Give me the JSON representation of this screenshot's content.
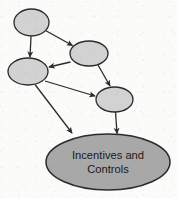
{
  "figure": {
    "type": "flow-diagram",
    "title": "",
    "background_color": "#fbfbfa",
    "stroke_color": "#2b2b2b",
    "node_fill_small": "#d2d2d2",
    "node_fill_outcome": "#a8a8a8",
    "text_color": "#1a1a1a"
  },
  "nodes": [
    {
      "id": "node-1",
      "name": "upper-left-node",
      "label": "",
      "cx": 31.5,
      "cy": 22.5,
      "rx": 17.5,
      "ry": 13.5,
      "fill": "#d2d2d2"
    },
    {
      "id": "node-2",
      "name": "upper-right-node",
      "label": "",
      "cx": 89.0,
      "cy": 53.5,
      "rx": 19.0,
      "ry": 12.5,
      "fill": "#d2d2d2"
    },
    {
      "id": "node-3",
      "name": "mid-left-node",
      "label": "",
      "cx": 28.0,
      "cy": 71.5,
      "rx": 20.0,
      "ry": 13.5,
      "fill": "#d2d2d2"
    },
    {
      "id": "node-4",
      "name": "mid-right-node",
      "label": "",
      "cx": 114.5,
      "cy": 99.5,
      "rx": 18.5,
      "ry": 12.5,
      "fill": "#d2d2d2"
    },
    {
      "id": "node-5",
      "name": "incentives-and-controls-node",
      "label_line_1": "Incentives and",
      "label_line_2": "Controls",
      "cx": 108.0,
      "cy": 162.0,
      "rx": 62.0,
      "ry": 28.0,
      "fill": "#a8a8a8"
    }
  ],
  "edges": [
    {
      "id": "edge-1",
      "name": "edge-upper-left-to-mid-left",
      "from": "node-1",
      "to": "node-3",
      "x1": 31.0,
      "y1": 36.5,
      "x2": 30.0,
      "y2": 57.0
    },
    {
      "id": "edge-2",
      "name": "edge-upper-left-to-upper-right",
      "from": "node-1",
      "to": "node-2",
      "x1": 45.5,
      "y1": 30.5,
      "x2": 72.5,
      "y2": 45.5
    },
    {
      "id": "edge-3",
      "name": "edge-upper-right-to-mid-left",
      "from": "node-2",
      "to": "node-3",
      "x1": 70.5,
      "y1": 62.0,
      "x2": 49.0,
      "y2": 67.0
    },
    {
      "id": "edge-4",
      "name": "edge-upper-right-to-mid-right",
      "from": "node-2",
      "to": "node-4",
      "x1": 98.0,
      "y1": 65.0,
      "x2": 110.0,
      "y2": 86.0
    },
    {
      "id": "edge-5",
      "name": "edge-mid-left-to-mid-right",
      "from": "node-3",
      "to": "node-4",
      "x1": 45.0,
      "y1": 81.0,
      "x2": 95.0,
      "y2": 96.0
    },
    {
      "id": "edge-6",
      "name": "edge-mid-left-to-outcome",
      "from": "node-3",
      "to": "node-5",
      "x1": 35.0,
      "y1": 84.5,
      "x2": 72.0,
      "y2": 133.0
    },
    {
      "id": "edge-7",
      "name": "edge-mid-right-to-outcome",
      "from": "node-4",
      "to": "node-5",
      "x1": 115.5,
      "y1": 112.0,
      "x2": 117.0,
      "y2": 133.5
    }
  ]
}
